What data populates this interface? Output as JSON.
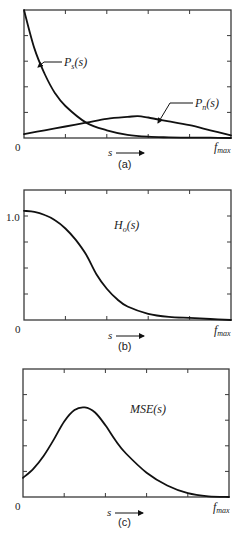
{
  "chart_data": [
    {
      "id": "a",
      "type": "line",
      "caption": "(a)",
      "xlabel": "s",
      "x_tick_labels": {
        "start": "0",
        "end": "f_max"
      },
      "y_tick_labels": [],
      "xlim": [
        0,
        1
      ],
      "ylim": [
        0,
        1
      ],
      "grid": false,
      "x_ticks": [
        0.2,
        0.4,
        0.6,
        0.8
      ],
      "y_ticks": [
        0.2,
        0.4,
        0.6,
        0.8
      ],
      "series": [
        {
          "name": "P_s(s)",
          "x": [
            0,
            0.05,
            0.1,
            0.15,
            0.2,
            0.3,
            0.4,
            0.5,
            0.6,
            0.7,
            0.8,
            0.9,
            1.0
          ],
          "values": [
            1.0,
            0.7,
            0.5,
            0.35,
            0.25,
            0.12,
            0.06,
            0.025,
            0.01,
            0.005,
            0.003,
            0.002,
            0.0
          ]
        },
        {
          "name": "P_n(s)",
          "x": [
            0,
            0.1,
            0.2,
            0.3,
            0.4,
            0.5,
            0.55,
            0.6,
            0.7,
            0.8,
            0.9,
            1.0
          ],
          "values": [
            0.03,
            0.06,
            0.09,
            0.12,
            0.15,
            0.165,
            0.17,
            0.16,
            0.13,
            0.1,
            0.06,
            0.02
          ]
        }
      ],
      "annotations": [
        {
          "text": "P_s(s)",
          "points_to": "P_s(s) curve near x≈0.06"
        },
        {
          "text": "P_n(s)",
          "points_to": "P_n(s) curve near x≈0.65"
        }
      ]
    },
    {
      "id": "b",
      "type": "line",
      "caption": "(b)",
      "xlabel": "s",
      "x_tick_labels": {
        "start": "0",
        "end": "f_max"
      },
      "y_tick_labels": [
        "1.0"
      ],
      "xlim": [
        0,
        1
      ],
      "ylim": [
        0,
        1.25
      ],
      "grid": false,
      "x_ticks": [
        0.2,
        0.4,
        0.6,
        0.8
      ],
      "y_ticks": [
        0.25,
        0.5,
        0.75,
        1.0
      ],
      "series": [
        {
          "name": "H_o(s)",
          "x": [
            0,
            0.05,
            0.1,
            0.15,
            0.2,
            0.25,
            0.3,
            0.35,
            0.4,
            0.45,
            0.5,
            0.6,
            0.7,
            0.8,
            0.9,
            1.0
          ],
          "values": [
            1.05,
            1.04,
            1.01,
            0.96,
            0.88,
            0.77,
            0.63,
            0.44,
            0.3,
            0.2,
            0.13,
            0.06,
            0.03,
            0.02,
            0.01,
            0.0
          ]
        }
      ],
      "annotations": [
        {
          "text": "H_o(s)"
        }
      ]
    },
    {
      "id": "c",
      "type": "line",
      "caption": "(c)",
      "xlabel": "s",
      "x_tick_labels": {
        "start": "0",
        "end": "f_max"
      },
      "y_tick_labels": [],
      "xlim": [
        0,
        1
      ],
      "ylim": [
        0,
        1
      ],
      "grid": false,
      "x_ticks": [
        0.2,
        0.4,
        0.6,
        0.8
      ],
      "y_ticks": [
        0.2,
        0.4,
        0.6,
        0.8
      ],
      "series": [
        {
          "name": "MSE(s)",
          "x": [
            0,
            0.05,
            0.1,
            0.15,
            0.2,
            0.25,
            0.3,
            0.35,
            0.4,
            0.45,
            0.5,
            0.6,
            0.7,
            0.8,
            0.9,
            1.0
          ],
          "values": [
            0.15,
            0.22,
            0.32,
            0.45,
            0.59,
            0.68,
            0.7,
            0.66,
            0.56,
            0.44,
            0.34,
            0.19,
            0.09,
            0.03,
            0.005,
            0.0
          ]
        }
      ],
      "annotations": [
        {
          "text": "MSE(s)"
        }
      ]
    }
  ],
  "labels": {
    "a": {
      "ps": "P",
      "ps_sub": "s",
      "ps_arg": "(s)",
      "pn": "P",
      "pn_sub": "n",
      "pn_arg": "(s)",
      "zero": "0",
      "fmax": "f",
      "fmax_sub": "max",
      "s": "s",
      "caption": "(a)"
    },
    "b": {
      "h": "H",
      "h_sub": "o",
      "h_arg": "(s)",
      "one": "1.0",
      "zero": "0",
      "fmax": "f",
      "fmax_sub": "max",
      "s": "s",
      "caption": "(b)"
    },
    "c": {
      "mse": "MSE(s)",
      "zero": "0",
      "fmax": "f",
      "fmax_sub": "max",
      "s": "s",
      "caption": "(c)"
    }
  }
}
